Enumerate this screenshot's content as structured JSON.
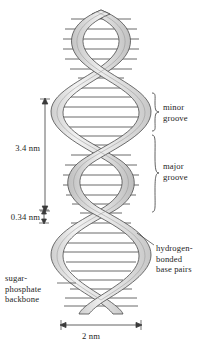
{
  "figure": {
    "background_color": "#ffffff",
    "ink_color": "#1d1d1d",
    "strand_fill": "#e8e8e8",
    "strand_edge": "#4a4a4a",
    "rung_color": "#595959"
  },
  "labels": {
    "minor_groove": "minor\ngroove",
    "major_groove": "major\ngroove",
    "hydrogen_bonded_base_pairs": "hydrogen-\nbonded\nbase pairs",
    "sugar_phosphate_backbone": "sugar-\nphosphate\nbackbone"
  },
  "measurements": {
    "helix_pitch": "3.4 nm",
    "base_rise": "0.34 nm",
    "helix_width": "2 nm"
  }
}
